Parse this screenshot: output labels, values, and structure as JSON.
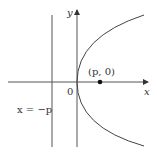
{
  "diagram": {
    "axes": {
      "x_label": "x",
      "y_label": "y"
    },
    "origin_label": "0",
    "focus_label": "(p, 0)",
    "directrix_label": "x = −p",
    "colors": {
      "line": "#555555",
      "curve": "#444444",
      "point": "#111111"
    }
  }
}
